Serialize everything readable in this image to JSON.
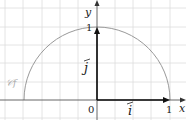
{
  "diagram": {
    "type": "unit semicircle with basis vectors",
    "curve_label": "𝒞f",
    "axis_x_label": "x",
    "axis_y_label": "y",
    "origin_label": "0",
    "x_tick_label": "1",
    "y_tick_label": "1",
    "vector_i_label": "i",
    "vector_j_label": "j",
    "colors": {
      "grid": "#dddddd",
      "axes": "#333333",
      "curve": "#999999",
      "curve_label": "#aaaaaa"
    }
  }
}
